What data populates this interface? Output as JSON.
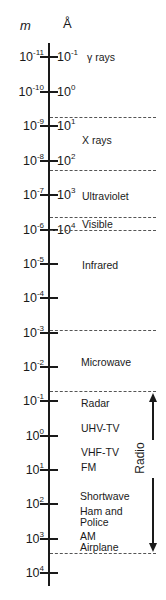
{
  "headers": {
    "meters": "m",
    "angstrom": "Å"
  },
  "ticks": [
    {
      "m_base": "10",
      "m_exp": "-11",
      "a_base": "10",
      "a_exp": "-1",
      "y": 57
    },
    {
      "m_base": "10",
      "m_exp": "-10",
      "a_base": "10",
      "a_exp": "0",
      "y": 92
    },
    {
      "m_base": "10",
      "m_exp": "-9",
      "a_base": "10",
      "a_exp": "1",
      "y": 126
    },
    {
      "m_base": "10",
      "m_exp": "-8",
      "a_base": "10",
      "a_exp": "2",
      "y": 161
    },
    {
      "m_base": "10",
      "m_exp": "-7",
      "a_base": "10",
      "a_exp": "3",
      "y": 195
    },
    {
      "m_base": "10",
      "m_exp": "-6",
      "a_base": "10",
      "a_exp": "4",
      "y": 230
    },
    {
      "m_base": "10",
      "m_exp": "-5",
      "y": 264
    },
    {
      "m_base": "10",
      "m_exp": "-4",
      "y": 298
    },
    {
      "m_base": "10",
      "m_exp": "-3",
      "y": 333
    },
    {
      "m_base": "10",
      "m_exp": "-2",
      "y": 367
    },
    {
      "m_base": "10",
      "m_exp": "-1",
      "y": 401
    },
    {
      "m_base": "10",
      "m_exp": "0",
      "y": 436
    },
    {
      "m_base": "10",
      "m_exp": "1",
      "y": 470
    },
    {
      "m_base": "10",
      "m_exp": "2",
      "y": 504
    },
    {
      "m_base": "10",
      "m_exp": "3",
      "y": 539
    },
    {
      "m_base": "10",
      "m_exp": "4",
      "y": 573
    }
  ],
  "boundaries_y": [
    117,
    170,
    217,
    230,
    330,
    391,
    553
  ],
  "regions": [
    {
      "label": "γ rays",
      "x": 87,
      "y": 51
    },
    {
      "label": "X rays",
      "x": 82,
      "y": 134
    },
    {
      "label": "Ultraviolet",
      "x": 82,
      "y": 190
    },
    {
      "label": "Visible",
      "x": 82,
      "y": 218
    },
    {
      "label": "Infrared",
      "x": 82,
      "y": 259
    },
    {
      "label": "Microwave",
      "x": 81,
      "y": 356
    },
    {
      "label": "Radar",
      "x": 81,
      "y": 397
    },
    {
      "label": "UHV-TV",
      "x": 81,
      "y": 422
    },
    {
      "label": "VHF-TV",
      "x": 81,
      "y": 446
    },
    {
      "label": "FM",
      "x": 81,
      "y": 461
    },
    {
      "label": "Shortwave",
      "x": 80,
      "y": 490
    },
    {
      "label": "Ham and",
      "x": 80,
      "y": 505
    },
    {
      "label": "Police",
      "x": 80,
      "y": 516
    },
    {
      "label": "AM",
      "x": 80,
      "y": 530
    },
    {
      "label": "Airplane",
      "x": 80,
      "y": 541
    }
  ],
  "radio": {
    "label": "Radio",
    "arrow_top_y": 395,
    "arrow_bottom_y": 553
  }
}
